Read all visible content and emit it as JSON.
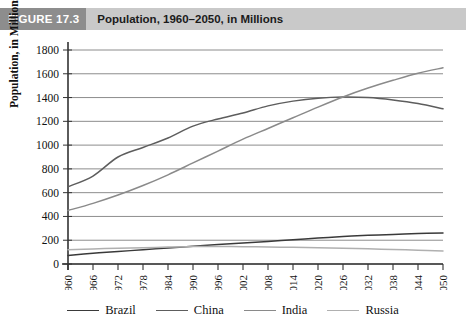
{
  "header": {
    "badge": "FIGURE 17.3",
    "title": "Population, 1960–2050, in Millions",
    "badge_bg": "#8d8d8d",
    "bar_bg": "#c9c9c9"
  },
  "axis": {
    "ylabel": "Population, in Millions",
    "yticks": [
      "0",
      "200",
      "400",
      "600",
      "800",
      "1000",
      "1200",
      "1400",
      "1600",
      "1800"
    ],
    "xticks": [
      "1960",
      "1966",
      "1972",
      "1978",
      "1984",
      "1990",
      "1996",
      "2002",
      "2008",
      "2014",
      "2020",
      "2026",
      "2032",
      "2038",
      "2044",
      "2050"
    ]
  },
  "legend": {
    "items": [
      {
        "label": "Brazil",
        "color": "#3a3a3a"
      },
      {
        "label": "China",
        "color": "#5d5d5d"
      },
      {
        "label": "India",
        "color": "#8a8a8a"
      },
      {
        "label": "Russia",
        "color": "#b0b0b0"
      }
    ]
  },
  "chart_data": {
    "type": "line",
    "title": "Population, 1960–2050, in Millions",
    "xlabel": "",
    "ylabel": "Population, in Millions",
    "xlim": [
      1960,
      2050
    ],
    "ylim": [
      0,
      1800
    ],
    "ytick_step": 200,
    "grid": true,
    "legend_position": "bottom",
    "x": [
      1960,
      1966,
      1972,
      1978,
      1984,
      1990,
      1996,
      2002,
      2008,
      2014,
      2020,
      2026,
      2032,
      2038,
      2044,
      2050
    ],
    "series": [
      {
        "name": "Brazil",
        "color": "#3a3a3a",
        "values": [
          72,
          90,
          105,
          120,
          135,
          150,
          163,
          177,
          190,
          204,
          218,
          231,
          241,
          249,
          256,
          261
        ]
      },
      {
        "name": "China",
        "color": "#5d5d5d",
        "values": [
          650,
          740,
          900,
          980,
          1060,
          1160,
          1220,
          1270,
          1330,
          1370,
          1395,
          1405,
          1400,
          1380,
          1350,
          1305
        ]
      },
      {
        "name": "India",
        "color": "#8a8a8a",
        "values": [
          450,
          510,
          580,
          660,
          750,
          850,
          950,
          1050,
          1140,
          1230,
          1320,
          1405,
          1480,
          1545,
          1605,
          1650
        ]
      },
      {
        "name": "Russia",
        "color": "#b0b0b0",
        "values": [
          120,
          127,
          132,
          137,
          142,
          147,
          148,
          146,
          143,
          140,
          136,
          132,
          128,
          122,
          116,
          110
        ]
      }
    ]
  }
}
